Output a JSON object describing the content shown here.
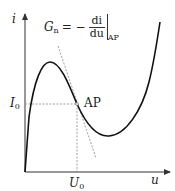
{
  "diagram": {
    "type": "current-voltage characteristic (negative differential conductance)",
    "axes": {
      "y_label": "i",
      "x_label": "u"
    },
    "operating_point": {
      "label": "AP",
      "current_label": "I",
      "current_sub": "0",
      "voltage_label": "U",
      "voltage_sub": "0"
    },
    "formula": {
      "lhs": "G",
      "lhs_sub": "n",
      "equals": "= −",
      "numerator": "di",
      "denominator": "du",
      "eval_sub": "AP"
    },
    "colors": {
      "curve": "#111111",
      "axes": "#333333",
      "dashed": "#888888"
    }
  }
}
